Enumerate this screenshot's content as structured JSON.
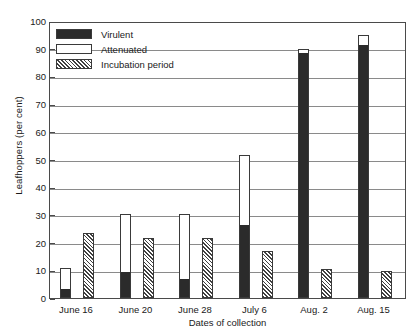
{
  "chart_data": {
    "type": "bar",
    "title": "",
    "xlabel": "Dates of collection",
    "ylabel": "Leafhoppers (per cent)",
    "ylim": [
      0,
      100
    ],
    "ytick_step": 10,
    "yticks": [
      0,
      10,
      20,
      30,
      40,
      50,
      60,
      70,
      80,
      90,
      100
    ],
    "grid": true,
    "legend_position": "upper-left-inside",
    "categories": [
      "June 16",
      "June 20",
      "June 28",
      "July 6",
      "Aug. 2",
      "Aug. 15"
    ],
    "series": [
      {
        "name": "Virulent",
        "values": [
          3,
          9,
          6.5,
          26,
          88,
          91
        ]
      },
      {
        "name": "Attenuated",
        "values": [
          11,
          30.5,
          30.5,
          51.5,
          90,
          95
        ]
      },
      {
        "name": "Incubation period",
        "values": [
          23.5,
          21.5,
          21.5,
          17,
          10.5,
          9.8
        ]
      }
    ]
  },
  "legend": {
    "items": [
      {
        "label": "Virulent",
        "swatch": "solid-black-swatch"
      },
      {
        "label": "Attenuated",
        "swatch": "white-outline-swatch"
      },
      {
        "label": "Incubation period",
        "swatch": "diagonal-hatch-swatch"
      }
    ]
  },
  "colors": {
    "virulent": "#2b2b2b",
    "attenuated": "#ffffff",
    "incubation_hatch": "#404040",
    "axis": "#4a4a4a",
    "gridline": "#8a8a8a"
  }
}
